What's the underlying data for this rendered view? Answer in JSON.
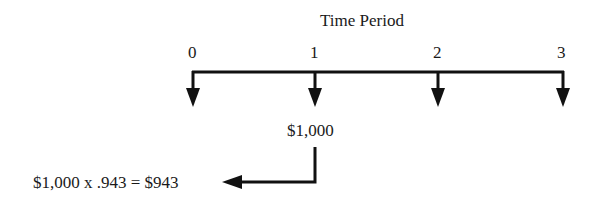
{
  "diagram": {
    "title": "Time Period",
    "periods": [
      "0",
      "1",
      "2",
      "3"
    ],
    "cash_flow": {
      "period": "1",
      "amount": "$1,000"
    },
    "discount_calc": "$1,000 x .943 = $943",
    "colors": {
      "line": "#111111",
      "text": "#1a1a1a",
      "background": "#ffffff"
    }
  }
}
